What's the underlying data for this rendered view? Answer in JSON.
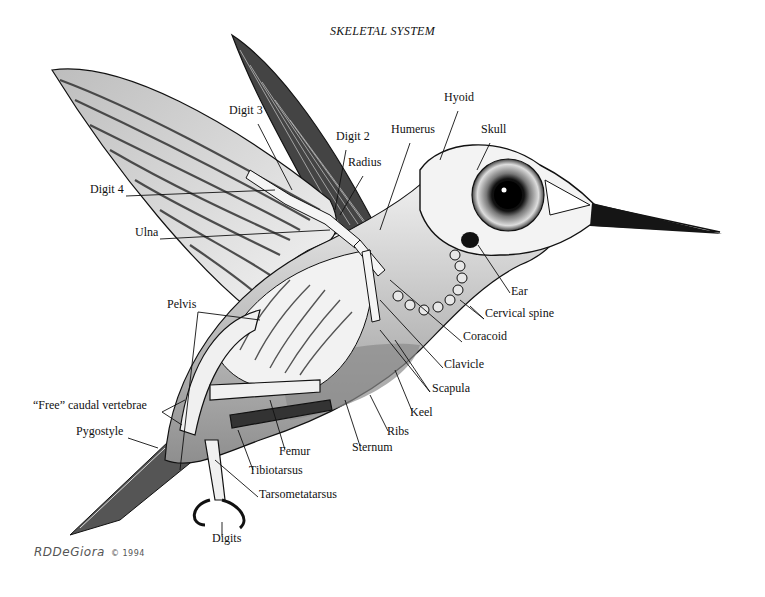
{
  "title": "SKELETAL SYSTEM",
  "signature": {
    "artist": "RDDeGiora",
    "year": "© 1994"
  },
  "colors": {
    "ink": "#111111",
    "paper": "#ffffff",
    "wing_dark": "#3a3a3a",
    "wing_light": "#d9d9d9",
    "body_shade": "#9a9a9a",
    "bone": "#f2f2f2"
  },
  "labels": [
    {
      "id": "digit-3",
      "text": "Digit 3",
      "x": 229,
      "y": 110,
      "line": [
        [
          258,
          124
        ],
        [
          292,
          190
        ]
      ]
    },
    {
      "id": "digit-2",
      "text": "Digit 2",
      "x": 336,
      "y": 136,
      "line": [
        [
          346,
          150
        ],
        [
          335,
          210
        ]
      ]
    },
    {
      "id": "radius",
      "text": "Radius",
      "x": 348,
      "y": 162,
      "line": [
        [
          363,
          176
        ],
        [
          340,
          215
        ]
      ]
    },
    {
      "id": "digit-4",
      "text": "Digit 4",
      "x": 90,
      "y": 189,
      "line": [
        [
          126,
          196
        ],
        [
          275,
          190
        ]
      ]
    },
    {
      "id": "ulna",
      "text": "Ulna",
      "x": 135,
      "y": 232,
      "line": [
        [
          160,
          239
        ],
        [
          330,
          230
        ]
      ]
    },
    {
      "id": "humerus",
      "text": "Humerus",
      "x": 391,
      "y": 129,
      "line": [
        [
          410,
          143
        ],
        [
          380,
          230
        ]
      ]
    },
    {
      "id": "hyoid",
      "text": "Hyoid",
      "x": 444,
      "y": 97,
      "line": [
        [
          458,
          111
        ],
        [
          440,
          160
        ]
      ]
    },
    {
      "id": "skull",
      "text": "Skull",
      "x": 481,
      "y": 129,
      "line": [
        [
          490,
          143
        ],
        [
          477,
          170
        ]
      ]
    },
    {
      "id": "ear",
      "text": "Ear",
      "x": 511,
      "y": 291,
      "line": [
        [
          510,
          293
        ],
        [
          478,
          245
        ]
      ]
    },
    {
      "id": "cervical-spine",
      "text": "Cervical spine",
      "x": 485,
      "y": 313,
      "line": [
        [
          484,
          319
        ],
        [
          470,
          306
        ]
      ]
    },
    {
      "id": "coracoid",
      "text": "Coracoid",
      "x": 463,
      "y": 336,
      "line": [
        [
          462,
          342
        ],
        [
          390,
          280
        ]
      ]
    },
    {
      "id": "clavicle",
      "text": "Clavicle",
      "x": 444,
      "y": 364,
      "line": [
        [
          443,
          368
        ],
        [
          380,
          300
        ]
      ]
    },
    {
      "id": "scapula",
      "text": "Scapula",
      "x": 432,
      "y": 388,
      "line": [
        [
          430,
          392
        ],
        [
          380,
          330
        ]
      ]
    },
    {
      "id": "keel",
      "text": "Keel",
      "x": 410,
      "y": 412,
      "line": [
        [
          412,
          411
        ],
        [
          395,
          370
        ]
      ]
    },
    {
      "id": "ribs",
      "text": "Ribs",
      "x": 387,
      "y": 431,
      "line": [
        [
          388,
          431
        ],
        [
          370,
          395
        ]
      ]
    },
    {
      "id": "sternum",
      "text": "Sternum",
      "x": 352,
      "y": 447,
      "line": [
        [
          360,
          446
        ],
        [
          345,
          400
        ]
      ]
    },
    {
      "id": "pelvis",
      "text": "Pelvis",
      "x": 167,
      "y": 304,
      "line": [
        [
          198,
          312
        ],
        [
          260,
          320
        ]
      ]
    },
    {
      "id": "free-caudal-vertebrae",
      "text": "“Free” caudal vertebrae",
      "x": 33,
      "y": 405,
      "line": [
        [
          162,
          412
        ],
        [
          185,
          400
        ]
      ]
    },
    {
      "id": "pygostyle",
      "text": "Pygostyle",
      "x": 76,
      "y": 431,
      "line": [
        [
          128,
          438
        ],
        [
          158,
          448
        ]
      ]
    },
    {
      "id": "femur",
      "text": "Femur",
      "x": 279,
      "y": 451,
      "line": [
        [
          285,
          450
        ],
        [
          270,
          400
        ]
      ]
    },
    {
      "id": "tibiotarsus",
      "text": "Tibiotarsus",
      "x": 249,
      "y": 470,
      "line": [
        [
          253,
          470
        ],
        [
          238,
          430
        ]
      ]
    },
    {
      "id": "tarsometatarsus",
      "text": "Tarsometatarsus",
      "x": 259,
      "y": 494,
      "line": [
        [
          258,
          497
        ],
        [
          215,
          460
        ]
      ]
    },
    {
      "id": "digits",
      "text": "Digits",
      "x": 212,
      "y": 538,
      "line": [
        [
          222,
          536
        ],
        [
          222,
          522
        ]
      ]
    }
  ],
  "extra_lines": [
    [
      [
        198,
        312
      ],
      [
        180,
        470
      ]
    ],
    [
      [
        162,
        412
      ],
      [
        182,
        425
      ]
    ],
    [
      [
        484,
        319
      ],
      [
        460,
        300
      ]
    ],
    [
      [
        430,
        392
      ],
      [
        395,
        340
      ]
    ]
  ]
}
